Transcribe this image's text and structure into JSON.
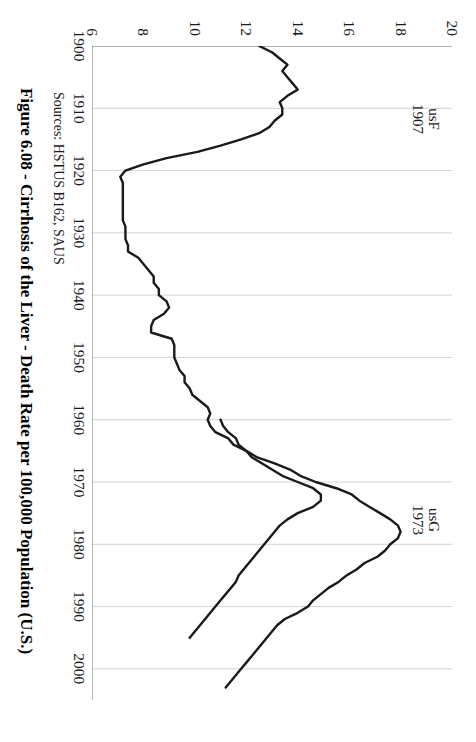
{
  "figure": {
    "caption": "Figure 6.08 - Cirrhosis of the Liver - Death Rate per 100,000 Population (U.S.)",
    "source_note": "Sources: HSTUS B162, SAUS"
  },
  "annotations": [
    {
      "name": "annotation-usf",
      "code": "usF",
      "year": "1907"
    },
    {
      "name": "annotation-usg",
      "code": "usG",
      "year": "1973"
    }
  ],
  "colors": {
    "line": "#1a1a1a",
    "grid": "#c8c8c8",
    "axis": "#7a7a7a",
    "text": "#1a1a1a"
  },
  "chart_data": {
    "type": "line",
    "title": "Figure 6.08 - Cirrhosis of the Liver - Death Rate per 100,000 Population (U.S.)",
    "xlabel": "",
    "ylabel": "Death Rate per 100,000 Population",
    "xlim": [
      1900,
      2005
    ],
    "ylim": [
      6,
      20
    ],
    "xticks": [
      1900,
      1910,
      1920,
      1930,
      1940,
      1950,
      1960,
      1970,
      1980,
      1990,
      2000
    ],
    "yticks": [
      6,
      8,
      10,
      12,
      14,
      16,
      18,
      20
    ],
    "grid": true,
    "legend": "none",
    "annotations": [
      {
        "label": "usF",
        "year": 1907,
        "note": "1907"
      },
      {
        "label": "usG",
        "year": 1973,
        "note": "1973"
      }
    ],
    "series": [
      {
        "name": "usF",
        "x": [
          1900,
          1901,
          1902,
          1903,
          1904,
          1905,
          1906,
          1907,
          1908,
          1909,
          1910,
          1911,
          1912,
          1913,
          1914,
          1915,
          1916,
          1917,
          1918,
          1919,
          1920,
          1921,
          1922,
          1923,
          1924,
          1925,
          1926,
          1927,
          1928,
          1929,
          1930,
          1931,
          1932,
          1933,
          1934,
          1935,
          1936,
          1937,
          1938,
          1939,
          1940,
          1941,
          1942,
          1943,
          1944,
          1945,
          1946,
          1947,
          1948,
          1949,
          1950,
          1951,
          1952,
          1953,
          1954,
          1955,
          1956,
          1957,
          1958,
          1959,
          1960,
          1961,
          1962,
          1963,
          1964,
          1965,
          1966,
          1967,
          1968,
          1969,
          1970,
          1971,
          1972,
          1973,
          1974,
          1975,
          1976,
          1977,
          1978,
          1979,
          1980,
          1981,
          1982,
          1983,
          1984,
          1985,
          1986,
          1987,
          1988,
          1989,
          1990,
          1991,
          1992,
          1993,
          1994,
          1995,
          1996,
          1997,
          1998,
          1999,
          2000,
          2001,
          2002,
          2003
        ],
        "y": [
          12.5,
          13.0,
          13.3,
          13.6,
          13.4,
          13.6,
          13.8,
          14.0,
          13.6,
          13.3,
          13.4,
          13.4,
          13.1,
          12.9,
          12.5,
          11.8,
          11.0,
          10.1,
          8.9,
          8.0,
          7.3,
          7.1,
          7.2,
          7.2,
          7.2,
          7.2,
          7.2,
          7.2,
          7.2,
          7.3,
          7.3,
          7.3,
          7.4,
          7.4,
          7.8,
          8.0,
          8.2,
          8.4,
          8.4,
          8.6,
          8.6,
          8.9,
          9.0,
          8.8,
          8.4,
          8.3,
          8.3,
          9.1,
          9.2,
          9.2,
          9.2,
          9.3,
          9.4,
          9.6,
          9.6,
          9.8,
          9.9,
          10.2,
          10.5,
          10.6,
          10.5,
          10.6,
          10.8,
          11.3,
          11.5,
          12.0,
          12.4,
          13.1,
          13.7,
          14.1,
          14.7,
          15.5,
          16.1,
          16.4,
          16.8,
          17.2,
          17.6,
          17.9,
          18.0,
          17.9,
          17.6,
          17.4,
          17.1,
          16.6,
          16.3,
          15.9,
          15.6,
          15.2,
          14.9,
          14.6,
          14.4,
          14.0,
          13.5,
          13.2,
          13.0,
          12.8,
          12.6,
          12.4,
          12.2,
          12.0,
          11.8,
          11.6,
          11.4,
          11.2
        ],
        "note": "Primary long series, begins 1900, peaks near 1973"
      },
      {
        "name": "usG",
        "x": [
          1960,
          1961,
          1962,
          1963,
          1964,
          1965,
          1966,
          1967,
          1968,
          1969,
          1970,
          1971,
          1972,
          1973,
          1974,
          1975,
          1976,
          1977,
          1978,
          1979,
          1980,
          1981,
          1982,
          1983,
          1984,
          1985,
          1986,
          1987,
          1988,
          1989,
          1990,
          1991,
          1992,
          1993,
          1994,
          1995
        ],
        "y": [
          11.0,
          11.1,
          11.3,
          11.6,
          11.7,
          12.0,
          12.2,
          12.6,
          13.0,
          13.4,
          14.0,
          14.6,
          14.9,
          14.9,
          14.6,
          14.0,
          13.6,
          13.3,
          13.1,
          12.9,
          12.7,
          12.5,
          12.3,
          12.1,
          11.9,
          11.7,
          11.6,
          11.4,
          11.2,
          11.0,
          10.8,
          10.6,
          10.4,
          10.2,
          10.0,
          9.8
        ],
        "note": "Secondary shorter series beginning mid-century"
      }
    ]
  }
}
